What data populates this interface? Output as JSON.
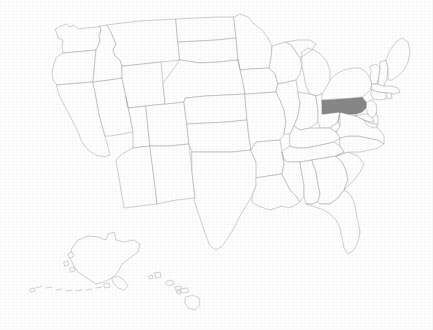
{
  "map": {
    "title": "United States state map",
    "type": "choropleth-single-highlight",
    "projection": "albers-usa",
    "canvas": {
      "width": 433,
      "height": 330
    },
    "background_color": "#fefefe",
    "border_color": "#a8a8a8",
    "default_state_fill": "#fefefe",
    "highlight_fill": "#878787",
    "highlight_border_color": "#7a7a7a",
    "border_width_px": 0.55,
    "labels_visible": false,
    "legend_visible": false,
    "title_visible": false,
    "highlighted_states": [
      "Pennsylvania"
    ],
    "highlighted_state_abbr": "PA",
    "insets": [
      "Alaska",
      "Hawaii"
    ],
    "state_count": 50,
    "regions": {
      "continental": {
        "x": 40,
        "y": 15,
        "width": 360,
        "height": 250
      },
      "alaska_inset": {
        "x": 40,
        "y": 235,
        "width": 115,
        "height": 65
      },
      "hawaii_inset": {
        "x": 150,
        "y": 262,
        "width": 52,
        "height": 40
      }
    },
    "states": [
      {
        "abbr": "WA",
        "name": "Washington",
        "highlighted": false
      },
      {
        "abbr": "OR",
        "name": "Oregon",
        "highlighted": false
      },
      {
        "abbr": "CA",
        "name": "California",
        "highlighted": false
      },
      {
        "abbr": "NV",
        "name": "Nevada",
        "highlighted": false
      },
      {
        "abbr": "ID",
        "name": "Idaho",
        "highlighted": false
      },
      {
        "abbr": "MT",
        "name": "Montana",
        "highlighted": false
      },
      {
        "abbr": "WY",
        "name": "Wyoming",
        "highlighted": false
      },
      {
        "abbr": "UT",
        "name": "Utah",
        "highlighted": false
      },
      {
        "abbr": "AZ",
        "name": "Arizona",
        "highlighted": false
      },
      {
        "abbr": "CO",
        "name": "Colorado",
        "highlighted": false
      },
      {
        "abbr": "NM",
        "name": "New Mexico",
        "highlighted": false
      },
      {
        "abbr": "ND",
        "name": "North Dakota",
        "highlighted": false
      },
      {
        "abbr": "SD",
        "name": "South Dakota",
        "highlighted": false
      },
      {
        "abbr": "NE",
        "name": "Nebraska",
        "highlighted": false
      },
      {
        "abbr": "KS",
        "name": "Kansas",
        "highlighted": false
      },
      {
        "abbr": "OK",
        "name": "Oklahoma",
        "highlighted": false
      },
      {
        "abbr": "TX",
        "name": "Texas",
        "highlighted": false
      },
      {
        "abbr": "MN",
        "name": "Minnesota",
        "highlighted": false
      },
      {
        "abbr": "IA",
        "name": "Iowa",
        "highlighted": false
      },
      {
        "abbr": "MO",
        "name": "Missouri",
        "highlighted": false
      },
      {
        "abbr": "AR",
        "name": "Arkansas",
        "highlighted": false
      },
      {
        "abbr": "LA",
        "name": "Louisiana",
        "highlighted": false
      },
      {
        "abbr": "WI",
        "name": "Wisconsin",
        "highlighted": false
      },
      {
        "abbr": "IL",
        "name": "Illinois",
        "highlighted": false
      },
      {
        "abbr": "MI",
        "name": "Michigan",
        "highlighted": false
      },
      {
        "abbr": "IN",
        "name": "Indiana",
        "highlighted": false
      },
      {
        "abbr": "OH",
        "name": "Ohio",
        "highlighted": false
      },
      {
        "abbr": "KY",
        "name": "Kentucky",
        "highlighted": false
      },
      {
        "abbr": "TN",
        "name": "Tennessee",
        "highlighted": false
      },
      {
        "abbr": "MS",
        "name": "Mississippi",
        "highlighted": false
      },
      {
        "abbr": "AL",
        "name": "Alabama",
        "highlighted": false
      },
      {
        "abbr": "GA",
        "name": "Georgia",
        "highlighted": false
      },
      {
        "abbr": "FL",
        "name": "Florida",
        "highlighted": false
      },
      {
        "abbr": "SC",
        "name": "South Carolina",
        "highlighted": false
      },
      {
        "abbr": "NC",
        "name": "North Carolina",
        "highlighted": false
      },
      {
        "abbr": "VA",
        "name": "Virginia",
        "highlighted": false
      },
      {
        "abbr": "WV",
        "name": "West Virginia",
        "highlighted": false
      },
      {
        "abbr": "MD",
        "name": "Maryland",
        "highlighted": false
      },
      {
        "abbr": "DE",
        "name": "Delaware",
        "highlighted": false
      },
      {
        "abbr": "NJ",
        "name": "New Jersey",
        "highlighted": false
      },
      {
        "abbr": "PA",
        "name": "Pennsylvania",
        "highlighted": true
      },
      {
        "abbr": "NY",
        "name": "New York",
        "highlighted": false
      },
      {
        "abbr": "CT",
        "name": "Connecticut",
        "highlighted": false
      },
      {
        "abbr": "RI",
        "name": "Rhode Island",
        "highlighted": false
      },
      {
        "abbr": "MA",
        "name": "Massachusetts",
        "highlighted": false
      },
      {
        "abbr": "VT",
        "name": "Vermont",
        "highlighted": false
      },
      {
        "abbr": "NH",
        "name": "New Hampshire",
        "highlighted": false
      },
      {
        "abbr": "ME",
        "name": "Maine",
        "highlighted": false
      },
      {
        "abbr": "AK",
        "name": "Alaska",
        "highlighted": false
      },
      {
        "abbr": "HI",
        "name": "Hawaii",
        "highlighted": false
      }
    ]
  }
}
